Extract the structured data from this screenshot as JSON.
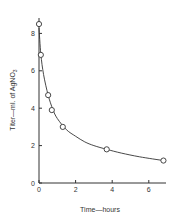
{
  "chart_data": {
    "type": "scatter",
    "title": "",
    "xlabel": "Time—hours",
    "ylabel": "Titer—ml. of AgNO",
    "ylabel_subscript": "3",
    "xlim": [
      0,
      7
    ],
    "ylim": [
      0,
      9
    ],
    "x_ticks": [
      0,
      2,
      4,
      6
    ],
    "y_ticks": [
      0,
      2,
      4,
      6,
      8
    ],
    "grid": false,
    "legend": null,
    "series": [
      {
        "name": "Observed titer",
        "marker": "open-circle",
        "x": [
          0.0,
          0.1,
          0.5,
          0.7,
          1.3,
          3.7,
          6.8
        ],
        "y": [
          8.5,
          6.85,
          4.7,
          3.9,
          3.0,
          1.8,
          1.2
        ]
      },
      {
        "name": "Fitted curve",
        "marker": "none",
        "line": "smooth",
        "x": [
          0.0,
          0.1,
          0.25,
          0.5,
          0.75,
          1.0,
          1.5,
          2.0,
          2.5,
          3.0,
          3.7,
          4.5,
          5.5,
          6.8
        ],
        "y": [
          8.3,
          6.9,
          5.8,
          4.7,
          3.95,
          3.45,
          2.85,
          2.5,
          2.2,
          2.0,
          1.8,
          1.6,
          1.4,
          1.2
        ]
      }
    ]
  }
}
